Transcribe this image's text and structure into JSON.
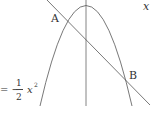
{
  "diagram": {
    "type": "graph",
    "elements": [
      {
        "kind": "parabola",
        "equation_label": "y = -1/2 x^2",
        "opens": "down"
      },
      {
        "kind": "line",
        "slope": "negative"
      },
      {
        "kind": "axis",
        "name": "y-axis"
      }
    ],
    "points": {
      "A": "A",
      "B": "B"
    },
    "labels": {
      "x_axis": "x",
      "equation_prefix": "= −",
      "frac_num": "1",
      "frac_den": "2",
      "equation_var": "x",
      "equation_exp": "2"
    },
    "colors": {
      "stroke": "#555555",
      "text": "#333333"
    }
  }
}
